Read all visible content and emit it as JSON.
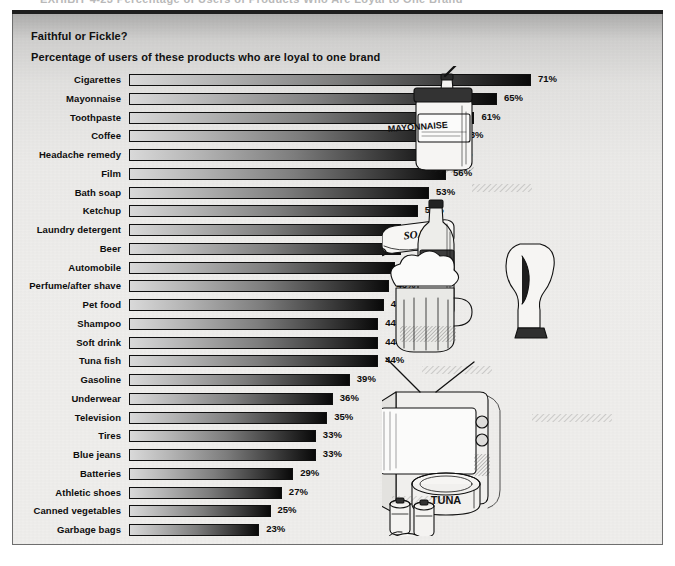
{
  "top_caption": {
    "text": "EXHIBIT 4-23   Percentage of Users of Products Who Are Loyal to One Brand"
  },
  "chart_data": {
    "type": "bar",
    "orientation": "horizontal",
    "title": "Faithful or Fickle?",
    "subtitle": "Percentage of users of these products who are loyal to one brand",
    "xlabel": "",
    "ylabel": "",
    "xlim": [
      0,
      71
    ],
    "grid": false,
    "legend": null,
    "value_suffix": "%",
    "categories": [
      "Cigarettes",
      "Mayonnaise",
      "Toothpaste",
      "Coffee",
      "Headache remedy",
      "Film",
      "Bath soap",
      "Ketchup",
      "Laundry detergent",
      "Beer",
      "Automobile",
      "Perfume/after shave",
      "Pet food",
      "Shampoo",
      "Soft drink",
      "Tuna fish",
      "Gasoline",
      "Underwear",
      "Television",
      "Tires",
      "Blue jeans",
      "Batteries",
      "Athletic shoes",
      "Canned vegetables",
      "Garbage bags"
    ],
    "values": [
      71,
      65,
      61,
      58,
      56,
      56,
      53,
      51,
      48,
      48,
      47,
      46,
      45,
      44,
      44,
      44,
      39,
      36,
      35,
      33,
      33,
      29,
      27,
      25,
      23
    ],
    "value_labels": [
      "71%",
      "65%",
      "61%",
      "58%",
      "56%",
      "56%",
      "53%",
      "51%",
      "48%",
      "48%",
      "47%",
      "46%",
      "45%",
      "44%",
      "44%",
      "44%",
      "39%",
      "36%",
      "35%",
      "33%",
      "33%",
      "29%",
      "27%",
      "25%",
      "23%"
    ],
    "bar_style": {
      "fill": "gradient light-gray to black, left to right",
      "outline": "#101010",
      "light_end": "#d9d9d9",
      "dark_end": "#090909"
    }
  },
  "illustration": {
    "description": "Pen-and-ink drawing of branded consumer products",
    "items": [
      {
        "name": "soda-bottle",
        "label": "SODA"
      },
      {
        "name": "mayonnaise-jar",
        "label": "MAYONNAISE"
      },
      {
        "name": "soap-bar",
        "label": "SOAP"
      },
      {
        "name": "beer-bottle",
        "label": "BEER"
      },
      {
        "name": "beer-mug",
        "label": ""
      },
      {
        "name": "ketchup-bottle",
        "label": ""
      },
      {
        "name": "headache-remedy-bottle",
        "label": "HEADACHE REMEDY"
      },
      {
        "name": "vegetable-can",
        "label": "VEGETABLES"
      },
      {
        "name": "film-roll",
        "label": "FILM"
      },
      {
        "name": "television-set",
        "label": ""
      },
      {
        "name": "cigarette-pack",
        "label": "CIGARETTES"
      },
      {
        "name": "coffee-mug",
        "label": ""
      },
      {
        "name": "tuna-can",
        "label": "TUNA"
      },
      {
        "name": "batteries",
        "label": ""
      },
      {
        "name": "athletic-shoe",
        "label": ""
      },
      {
        "name": "toothpaste-tube",
        "label": ""
      }
    ]
  },
  "style": {
    "frame_border": "#6e6e6e",
    "background": "#efeeec",
    "text_color": "#0d0d0d",
    "rule_color": "#1d1d1d"
  }
}
